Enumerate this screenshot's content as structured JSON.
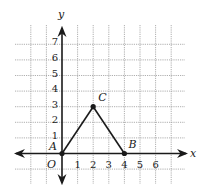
{
  "diagram": {
    "type": "coordinate-plane",
    "axes": {
      "x_label": "x",
      "y_label": "y",
      "origin_label": "O",
      "x_ticks": [
        "1",
        "2",
        "3",
        "4",
        "5",
        "6"
      ],
      "y_ticks": [
        "1",
        "2",
        "3",
        "4",
        "5",
        "6",
        "7"
      ],
      "grid_x_range": [
        -2,
        7
      ],
      "grid_y_range": [
        -1,
        7
      ]
    },
    "points": [
      {
        "label": "A",
        "x": 0,
        "y": 0
      },
      {
        "label": "B",
        "x": 4,
        "y": 0
      },
      {
        "label": "C",
        "x": 2,
        "y": 3
      }
    ],
    "segments": [
      {
        "from": "A",
        "to": "C"
      },
      {
        "from": "C",
        "to": "B"
      }
    ],
    "colors": {
      "ink": "#1a1a1a",
      "grid": "#9a9a9a",
      "background": "#ffffff"
    }
  }
}
